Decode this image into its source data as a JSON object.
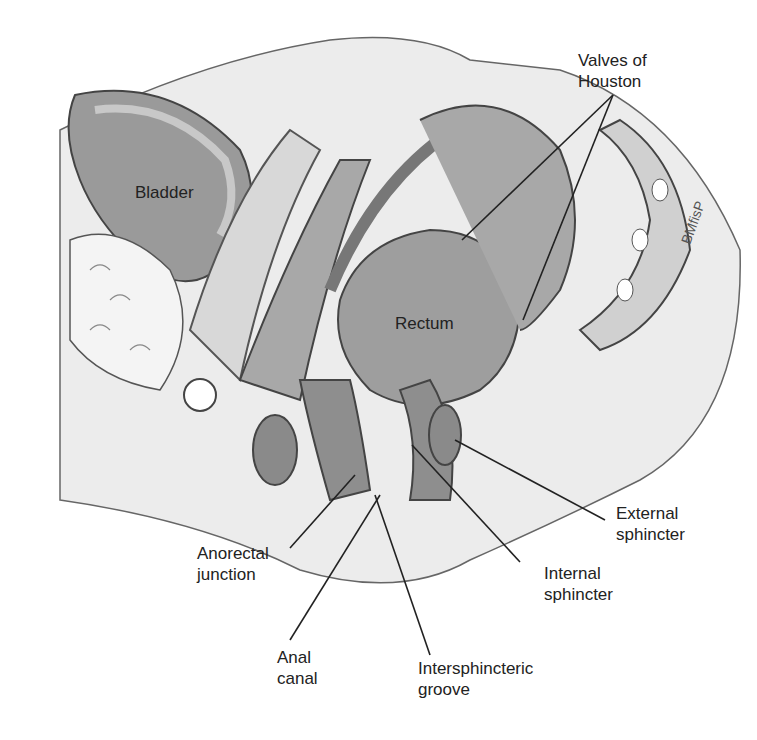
{
  "diagram": {
    "labels": {
      "valves": "Valves of\nHouston",
      "bladder": "Bladder",
      "rectum": "Rectum",
      "external": "External\nsphincter",
      "internal": "Internal\nsphincter",
      "anorectal": "Anorectal\njunction",
      "anal_canal": "Anal\ncanal",
      "intersphincteric": "Intersphincteric\ngroove"
    },
    "colors": {
      "tissue_dark": "#8c8c8c",
      "tissue_mid": "#b3b3b3",
      "tissue_light": "#d6d6d6",
      "outline": "#444444",
      "leader": "#222222"
    }
  }
}
